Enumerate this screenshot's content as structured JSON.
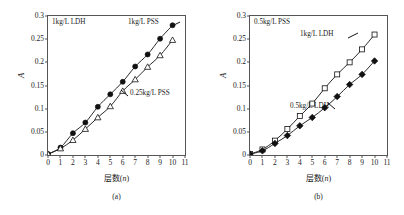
{
  "figure": {
    "captions": {
      "a": "(a)",
      "b": "(b)"
    }
  },
  "chart_data": [
    {
      "type": "scatter",
      "panel": "(a)",
      "title": "",
      "xlabel": "层数(n)",
      "ylabel": "A",
      "xlim": [
        0,
        11
      ],
      "ylim": [
        0,
        0.3
      ],
      "xticks": [
        0,
        1,
        2,
        3,
        4,
        5,
        6,
        7,
        8,
        9,
        10,
        11
      ],
      "xticklabels": [
        "0",
        "1",
        "2",
        "3",
        "4",
        "5",
        "6",
        "7",
        "8",
        "9",
        "10",
        "11"
      ],
      "yticks": [
        0,
        0.05,
        0.1,
        0.15,
        0.2,
        0.25,
        0.3
      ],
      "yticklabels": [
        "0",
        "0.05",
        "0.1",
        "0.15",
        "0.2",
        "0.25",
        "0.3"
      ],
      "grid": false,
      "legend_position": "in-plot-annotations",
      "annotations": [
        {
          "text": "1kg/L LDH",
          "x_px": 52,
          "y_px": 19
        },
        {
          "text": "1kg/L PSS",
          "x_px": 128,
          "y_px": 19
        },
        {
          "text": "0.25kg/L PSS",
          "x_px": 130,
          "y_px": 90
        }
      ],
      "series": [
        {
          "name": "1kg/L PSS",
          "marker": "filled-circle",
          "x": [
            0,
            1,
            2,
            3,
            4,
            5,
            6,
            7,
            8,
            9,
            10
          ],
          "values": [
            0.002,
            0.016,
            0.047,
            0.07,
            0.104,
            0.131,
            0.158,
            0.191,
            0.217,
            0.251,
            0.28
          ]
        },
        {
          "name": "0.25kg/L PSS",
          "marker": "open-triangle",
          "x": [
            0,
            1,
            2,
            3,
            4,
            5,
            6,
            7,
            8,
            9,
            10
          ],
          "values": [
            0.002,
            0.014,
            0.032,
            0.056,
            0.081,
            0.105,
            0.138,
            0.163,
            0.19,
            0.215,
            0.248
          ]
        }
      ]
    },
    {
      "type": "scatter",
      "panel": "(b)",
      "title": "",
      "xlabel": "层数(n)",
      "ylabel": "A",
      "xlim": [
        0,
        11
      ],
      "ylim": [
        0,
        0.3
      ],
      "xticks": [
        0,
        1,
        2,
        3,
        4,
        5,
        6,
        7,
        8,
        9,
        10,
        11
      ],
      "xticklabels": [
        "0",
        "1",
        "2",
        "3",
        "4",
        "5",
        "6",
        "7",
        "8",
        "9",
        "10",
        "11"
      ],
      "yticks": [
        0,
        0.05,
        0.1,
        0.15,
        0.2,
        0.25,
        0.3
      ],
      "yticklabels": [
        "0",
        "0.05",
        "0.1",
        "0.15",
        "0.2",
        "0.25",
        "0.3"
      ],
      "grid": false,
      "legend_position": "in-plot-annotations",
      "annotations": [
        {
          "text": "0.5kg/L PSS",
          "x_px": 52,
          "y_px": 19
        },
        {
          "text": "1kg/L LDH",
          "x_px": 98,
          "y_px": 31
        },
        {
          "text": "0.5kg/L LDH",
          "x_px": 88,
          "y_px": 103
        }
      ],
      "series": [
        {
          "name": "1kg/L LDH",
          "marker": "open-square",
          "x": [
            0,
            1,
            2,
            3,
            4,
            5,
            6,
            7,
            8,
            9,
            10
          ],
          "values": [
            0.002,
            0.012,
            0.031,
            0.056,
            0.084,
            0.111,
            0.144,
            0.174,
            0.2,
            0.228,
            0.26
          ]
        },
        {
          "name": "0.5kg/L LDH",
          "marker": "filled-diamond",
          "x": [
            0,
            1,
            2,
            3,
            4,
            5,
            6,
            7,
            8,
            9,
            10
          ],
          "values": [
            0.002,
            0.009,
            0.025,
            0.042,
            0.063,
            0.081,
            0.102,
            0.126,
            0.152,
            0.174,
            0.203
          ]
        }
      ]
    }
  ]
}
